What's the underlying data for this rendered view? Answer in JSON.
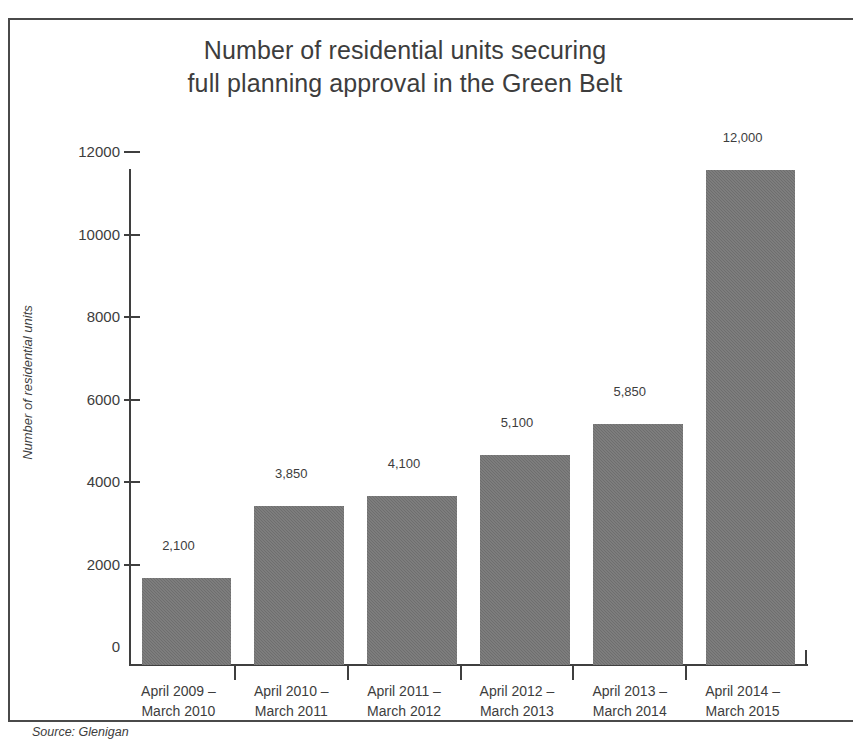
{
  "figure": {
    "title_line1": "Number of residential units securing",
    "title_line2": "full planning approval in the Green Belt",
    "source": "Source: Glenigan",
    "border_color": "#4a4a4a",
    "background": "#ffffff"
  },
  "chart_data": {
    "type": "bar",
    "title": "Number of residential units securing full planning approval in the Green Belt",
    "subtitle": "",
    "xlabel": "",
    "ylabel": "Number of residential units",
    "ylim": [
      0,
      12000
    ],
    "grid": false,
    "legend": null,
    "bar_color": "#6e6e6e",
    "categories": [
      "April 2009 – March 2010",
      "April 2010 – March 2011",
      "April 2011 – March 2012",
      "April 2012 – March 2013",
      "April 2013 – March 2014",
      "April 2014 – March 2015"
    ],
    "category_lines": [
      [
        "April 2009 –",
        "March 2010"
      ],
      [
        "April 2010 –",
        "March 2011"
      ],
      [
        "April 2011 –",
        "March 2012"
      ],
      [
        "April 2012 –",
        "March 2013"
      ],
      [
        "April 2013 –",
        "March 2014"
      ],
      [
        "April 2014 –",
        "March 2015"
      ]
    ],
    "values": [
      2100,
      3850,
      4100,
      5100,
      5850,
      12000
    ],
    "value_labels": [
      "2,100",
      "3,850",
      "4,100",
      "5,100",
      "5,850",
      "12,000"
    ],
    "yticks": [
      0,
      2000,
      4000,
      6000,
      8000,
      10000,
      12000
    ],
    "ytick_labels": [
      "0",
      "2000",
      "4000",
      "6000",
      "8000",
      "10000",
      "12000"
    ]
  }
}
